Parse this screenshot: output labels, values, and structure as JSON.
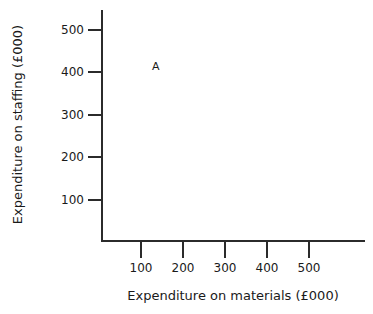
{
  "chart_data": {
    "type": "scatter",
    "title": "",
    "xlabel": "Expenditure on materials (£000)",
    "ylabel": "Expenditure on staffing (£000)",
    "xlim": [
      0,
      625
    ],
    "ylim": [
      0,
      550
    ],
    "grid": false,
    "legend": "none",
    "x_ticks": [
      {
        "value": 100,
        "label": "100",
        "px": 141
      },
      {
        "value": 200,
        "label": "200",
        "px": 183
      },
      {
        "value": 300,
        "label": "300",
        "px": 225
      },
      {
        "value": 400,
        "label": "400",
        "px": 267
      },
      {
        "value": 500,
        "label": "500",
        "px": 309
      }
    ],
    "y_ticks": [
      {
        "value": 500,
        "label": "500",
        "px": 30
      },
      {
        "value": 400,
        "label": "400",
        "px": 72
      },
      {
        "value": 300,
        "label": "300",
        "px": 115
      },
      {
        "value": 200,
        "label": "200",
        "px": 157
      },
      {
        "value": 100,
        "label": "100",
        "px": 200
      }
    ],
    "points": [
      {
        "label": "A",
        "x": 130,
        "y": 410,
        "px": 152,
        "py": 61
      }
    ]
  },
  "axes": {
    "x_title": "Expenditure on materials (£000)",
    "y_title": "Expenditure on staffing (£000)"
  },
  "colors": {
    "axis": "#2b2b2b",
    "text": "#1a1a1a",
    "background": "#ffffff"
  }
}
